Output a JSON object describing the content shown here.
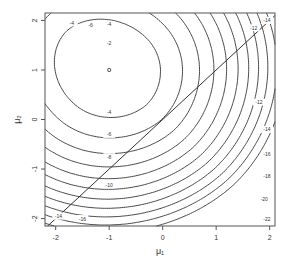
{
  "chart_data": {
    "type": "contour",
    "title": "",
    "xlabel": "μ₁",
    "ylabel": "μ₂",
    "xlim": [
      -2.2,
      2.1
    ],
    "ylim": [
      -2.15,
      2.15
    ],
    "x_ticks": [
      -2,
      -1,
      0,
      1,
      2
    ],
    "y_ticks": [
      -2,
      -1,
      0,
      1,
      2
    ],
    "x_tick_labels": [
      "-2",
      "-1",
      "0",
      "1",
      "2"
    ],
    "y_tick_labels": [
      "-2",
      "-1",
      "0",
      "1",
      "2"
    ],
    "grid": false,
    "maximum": {
      "mu1": -1,
      "mu2": 1,
      "value": 0
    },
    "contour_levels": [
      0,
      -2,
      -4,
      -6,
      -8,
      -10,
      -12,
      -14,
      -16,
      -18,
      -20,
      -22
    ],
    "contour_labels": [
      {
        "text": "0",
        "mu1": -1.0,
        "mu2": 1.0
      },
      {
        "text": "-2",
        "mu1": -1.0,
        "mu2": 1.55
      },
      {
        "text": "-4",
        "mu1": -1.0,
        "mu2": 1.92
      },
      {
        "text": "-4",
        "mu1": -1.0,
        "mu2": 0.15
      },
      {
        "text": "-6",
        "mu1": -1.0,
        "mu2": -0.3
      },
      {
        "text": "-8",
        "mu1": -1.0,
        "mu2": -0.75
      },
      {
        "text": "-10",
        "mu1": -1.0,
        "mu2": -1.32
      },
      {
        "text": "-12",
        "mu1": 1.7,
        "mu2": 1.85
      },
      {
        "text": "-14",
        "mu1": 1.95,
        "mu2": 2.0
      },
      {
        "text": "-12",
        "mu1": 1.8,
        "mu2": 0.35
      },
      {
        "text": "-14",
        "mu1": 1.95,
        "mu2": -0.2
      },
      {
        "text": "-16",
        "mu1": 1.95,
        "mu2": -0.7
      },
      {
        "text": "-18",
        "mu1": 1.95,
        "mu2": -1.15
      },
      {
        "text": "-20",
        "mu1": 1.9,
        "mu2": -1.6
      },
      {
        "text": "-22",
        "mu1": 1.95,
        "mu2": -2.0
      },
      {
        "text": "-4",
        "mu1": -1.7,
        "mu2": 1.95
      },
      {
        "text": "-6",
        "mu1": -1.35,
        "mu2": 1.9
      },
      {
        "text": "-14",
        "mu1": -1.95,
        "mu2": -1.95
      },
      {
        "text": "-16",
        "mu1": -1.5,
        "mu2": -2.0
      }
    ],
    "reference_line": {
      "type": "identity",
      "equation": "μ₂ = μ₁"
    },
    "model": {
      "description": "Normalized log-likelihood surface",
      "data_points": [
        -1,
        -1,
        -1,
        -1,
        1,
        1,
        1
      ],
      "weight_component_1": 0.5,
      "sd": 1
    }
  }
}
